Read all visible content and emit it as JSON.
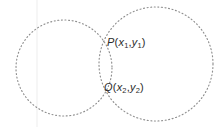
{
  "figure": {
    "kind": "two-intersecting-circles-diagram",
    "background_color": "#ffffff",
    "stroke_color": "#8a8a8a",
    "label_color": "#2b2b2b",
    "canvas": {
      "width": 224,
      "height": 127
    },
    "shapes": [
      {
        "name": "left-circle",
        "type": "circle",
        "cx": 64,
        "cy": 68,
        "r": 48,
        "stroke": "#8f8f8f",
        "dash": "1 2.6",
        "fill": "none"
      },
      {
        "name": "right-circle",
        "type": "circle",
        "cx": 156,
        "cy": 64,
        "r": 57,
        "stroke": "#8f8f8f",
        "dash": "1 2.6",
        "fill": "none"
      }
    ],
    "guide": {
      "name": "faint-vertical-line",
      "x": 37,
      "y1": 0,
      "y2": 127,
      "stroke": "#ededed"
    },
    "points": [
      {
        "id": "P",
        "name": "upper-intersection-point",
        "letter": "P",
        "x_var": "x",
        "x_sub": "1",
        "y_var": "y",
        "y_sub": "1",
        "text": "P(x1,y1)",
        "at": {
          "x": 103,
          "y": 42
        }
      },
      {
        "id": "Q",
        "name": "lower-intersection-point",
        "letter": "Q",
        "x_var": "x",
        "x_sub": "2",
        "y_var": "y",
        "y_sub": "2",
        "text": "Q(x2,y2)",
        "at": {
          "x": 103,
          "y": 87
        }
      }
    ]
  }
}
